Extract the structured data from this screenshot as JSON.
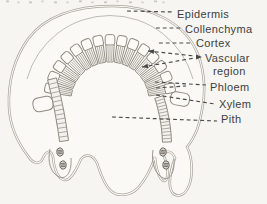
{
  "figure": {
    "name": "plant-stem-cross-section-diagram",
    "background": "#f6f5f1",
    "paper_fill": "#faf9f5",
    "outline_color": "#a8a39b",
    "leader_color": "#4a4a4a",
    "text_color": "#3e3e3e",
    "labels": [
      {
        "id": "epidermis",
        "text": "Epidermis",
        "x": 177,
        "y": 18,
        "leaders": [
          {
            "from": [
              127,
              11
            ],
            "to": [
              174,
              12
            ]
          }
        ]
      },
      {
        "id": "collenchyma",
        "text": "Collenchyma",
        "x": 185,
        "y": 33,
        "leaders": [
          {
            "from": [
              156,
              28
            ],
            "to": [
              182,
              28
            ]
          }
        ]
      },
      {
        "id": "cortex",
        "text": "Cortex",
        "x": 196,
        "y": 47,
        "leaders": [
          {
            "from": [
              159,
              43
            ],
            "to": [
              193,
              43
            ]
          }
        ]
      },
      {
        "id": "vascular-region",
        "lines": [
          "Vascular",
          "region"
        ],
        "x": 205,
        "y": 62,
        "x2": 213,
        "y2": 75,
        "leaders": [
          {
            "from": [
              148,
              51
            ],
            "to": [
              195,
              56
            ],
            "arrow_from": true
          },
          {
            "from": [
              142,
              67
            ],
            "to": [
              195,
              58
            ],
            "arrow_from": true
          }
        ],
        "arrow": {
          "x": 202,
          "y": 57,
          "angle": 0
        }
      },
      {
        "id": "phloem",
        "text": "Phloem",
        "x": 210,
        "y": 91,
        "leaders": [
          {
            "from": [
              155,
              82
            ],
            "to": [
              206,
              85
            ]
          },
          {
            "from": [
              156,
              88
            ],
            "to": [
              186,
              86
            ]
          }
        ]
      },
      {
        "id": "xylem",
        "text": "Xylem",
        "x": 219,
        "y": 108,
        "leaders": [
          {
            "from": [
              156,
              95
            ],
            "to": [
              215,
              104
            ]
          }
        ]
      },
      {
        "id": "pith",
        "text": "Pith",
        "x": 221,
        "y": 123,
        "leaders": [
          {
            "from": [
              112,
              117
            ],
            "to": [
              217,
              121
            ]
          }
        ]
      }
    ]
  }
}
